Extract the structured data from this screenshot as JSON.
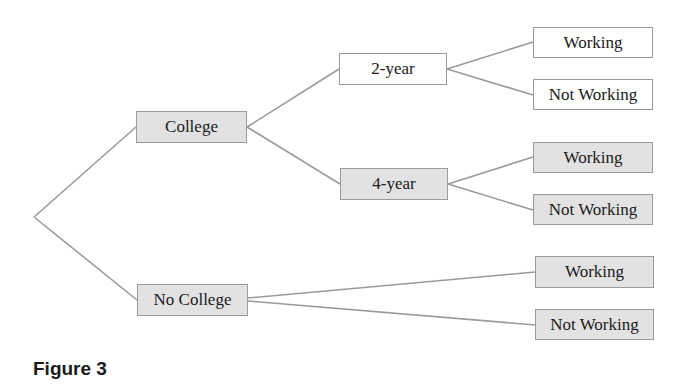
{
  "figure": {
    "caption": "Figure 3",
    "type": "tree-diagram"
  },
  "colors": {
    "shaded_node": "#e2e2e2",
    "unshaded_node": "#ffffff",
    "edge": "#9a9a9a",
    "border": "#9a9a9a"
  },
  "tree": {
    "root": "",
    "level1": [
      {
        "label": "College",
        "shaded": true
      },
      {
        "label": "No College",
        "shaded": true
      }
    ],
    "college_branches": [
      {
        "label": "2-year",
        "shaded": false
      },
      {
        "label": "4-year",
        "shaded": true
      }
    ],
    "two_year_outcomes": [
      {
        "label": "Working",
        "shaded": false
      },
      {
        "label": "Not Working",
        "shaded": false
      }
    ],
    "four_year_outcomes": [
      {
        "label": "Working",
        "shaded": true
      },
      {
        "label": "Not Working",
        "shaded": true
      }
    ],
    "no_college_outcomes": [
      {
        "label": "Working",
        "shaded": true
      },
      {
        "label": "Not Working",
        "shaded": true
      }
    ]
  }
}
